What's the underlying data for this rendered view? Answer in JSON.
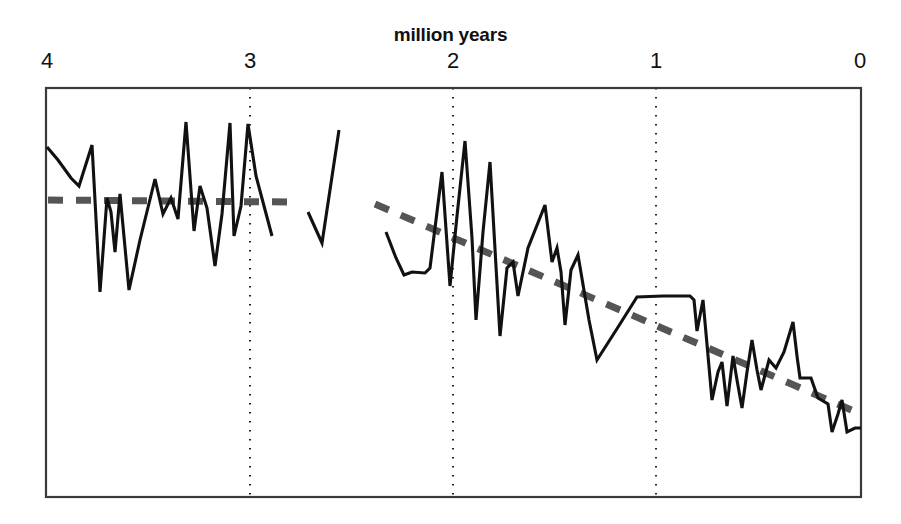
{
  "chart_data": {
    "type": "line",
    "title": "million years",
    "xlabel": "million years",
    "ylabel": "",
    "xlim": [
      4,
      0
    ],
    "ylim": [
      0,
      1
    ],
    "x_axis_reversed": true,
    "grid": false,
    "legend": null,
    "x_tick_labels": [
      "4",
      "3",
      "2",
      "1",
      "0"
    ],
    "x_tick_values": [
      4,
      3,
      2,
      1,
      0
    ],
    "x_tick_pixels": [
      47,
      250,
      453,
      656,
      860
    ],
    "gridline_style": "dotted vertical at 3, 2 and 1 million years",
    "plot_box": {
      "left": 46,
      "top": 88,
      "right": 861,
      "bottom": 497
    },
    "series": [
      {
        "name": "record-segment-1",
        "style": "solid-black-jagged",
        "points_px": [
          [
            47,
            147
          ],
          [
            58,
            160
          ],
          [
            71,
            178
          ],
          [
            79,
            186
          ],
          [
            92,
            145
          ],
          [
            100,
            292
          ],
          [
            107,
            198
          ],
          [
            111,
            212
          ],
          [
            115,
            252
          ],
          [
            120,
            194
          ],
          [
            129,
            290
          ],
          [
            140,
            240
          ],
          [
            155,
            179
          ],
          [
            163,
            214
          ],
          [
            171,
            198
          ],
          [
            178,
            219
          ],
          [
            186,
            122
          ],
          [
            194,
            231
          ],
          [
            200,
            186
          ],
          [
            207,
            208
          ],
          [
            215,
            266
          ],
          [
            222,
            214
          ],
          [
            230,
            123
          ],
          [
            234,
            236
          ],
          [
            241,
            206
          ],
          [
            248,
            124
          ],
          [
            256,
            176
          ],
          [
            272,
            236
          ]
        ]
      },
      {
        "name": "record-segment-2",
        "style": "solid-black-jagged",
        "points_px": [
          [
            308,
            212
          ],
          [
            322,
            243
          ],
          [
            339,
            130
          ]
        ]
      },
      {
        "name": "record-segment-3",
        "style": "solid-black-jagged",
        "points_px": [
          [
            386,
            232
          ],
          [
            396,
            258
          ],
          [
            404,
            275
          ],
          [
            412,
            272
          ],
          [
            425,
            273
          ],
          [
            430,
            268
          ],
          [
            442,
            172
          ],
          [
            450,
            286
          ],
          [
            457,
            216
          ],
          [
            465,
            141
          ],
          [
            472,
            238
          ],
          [
            476,
            320
          ],
          [
            483,
            232
          ],
          [
            490,
            162
          ],
          [
            495,
            249
          ],
          [
            500,
            336
          ],
          [
            507,
            268
          ],
          [
            513,
            262
          ],
          [
            518,
            296
          ],
          [
            528,
            248
          ],
          [
            545,
            205
          ],
          [
            552,
            262
          ],
          [
            557,
            248
          ],
          [
            561,
            272
          ],
          [
            565,
            325
          ],
          [
            571,
            270
          ],
          [
            578,
            255
          ],
          [
            589,
            320
          ],
          [
            597,
            360
          ],
          [
            620,
            324
          ],
          [
            637,
            297
          ],
          [
            663,
            296
          ],
          [
            690,
            296
          ],
          [
            694,
            300
          ],
          [
            697,
            331
          ],
          [
            703,
            300
          ],
          [
            712,
            400
          ],
          [
            718,
            372
          ],
          [
            722,
            362
          ],
          [
            727,
            406
          ],
          [
            733,
            356
          ],
          [
            737,
            380
          ],
          [
            742,
            408
          ],
          [
            747,
            372
          ],
          [
            752,
            340
          ],
          [
            757,
            370
          ],
          [
            761,
            390
          ],
          [
            769,
            360
          ],
          [
            776,
            368
          ],
          [
            784,
            352
          ],
          [
            793,
            322
          ],
          [
            797,
            356
          ],
          [
            800,
            378
          ],
          [
            811,
            378
          ],
          [
            818,
            398
          ],
          [
            828,
            404
          ],
          [
            832,
            432
          ],
          [
            838,
            414
          ],
          [
            842,
            400
          ],
          [
            847,
            432
          ],
          [
            855,
            428
          ],
          [
            861,
            428
          ]
        ]
      }
    ],
    "trend_lines": [
      {
        "name": "trend-line-early",
        "style": "dashed-gray-thick",
        "from_px": [
          48,
          200
        ],
        "to_px": [
          287,
          202
        ],
        "slope": "flat"
      },
      {
        "name": "trend-line-late",
        "style": "dashed-gray-thick",
        "from_px": [
          375,
          204
        ],
        "to_px": [
          856,
          412
        ],
        "slope": "declining"
      }
    ],
    "annotations": []
  },
  "colors": {
    "data_line": "#111111",
    "trend_line": "#555555",
    "axis": "#3a3a3a",
    "gridline": "#222222",
    "background": "#ffffff",
    "text": "#111111"
  },
  "axis": {
    "title": "million years",
    "ticks": [
      {
        "label": "4",
        "x": 47
      },
      {
        "label": "3",
        "x": 250
      },
      {
        "label": "2",
        "x": 453
      },
      {
        "label": "1",
        "x": 656
      },
      {
        "label": "0",
        "x": 860
      }
    ]
  }
}
